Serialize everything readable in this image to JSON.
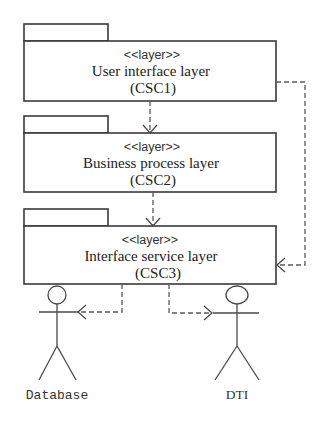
{
  "diagram": {
    "type": "UML package/layer diagram",
    "packages": [
      {
        "id": "csc1",
        "stereotype": "<<layer>>",
        "name": "User interface layer",
        "code": "(CSC1)"
      },
      {
        "id": "csc2",
        "stereotype": "<<layer>>",
        "name": "Business process layer",
        "code": "(CSC2)"
      },
      {
        "id": "csc3",
        "stereotype": "<<layer>>",
        "name": "Interface service layer",
        "code": "(CSC3)"
      }
    ],
    "actors": [
      {
        "id": "database",
        "label": "Database"
      },
      {
        "id": "dti",
        "label": "DTI"
      }
    ],
    "dependencies": [
      {
        "from": "csc1",
        "to": "csc2",
        "style": "dashed-open-arrow"
      },
      {
        "from": "csc2",
        "to": "csc3",
        "style": "dashed-open-arrow"
      },
      {
        "from": "csc1",
        "to": "csc3",
        "style": "dashed-open-arrow"
      },
      {
        "from": "csc3",
        "to": "database",
        "style": "dashed-open-arrow"
      },
      {
        "from": "csc3",
        "to": "dti",
        "style": "dashed-open-arrow"
      }
    ],
    "caption_fragment": ""
  },
  "colors": {
    "line": "#3a3a3a",
    "text": "#222222",
    "background": "#ffffff"
  }
}
